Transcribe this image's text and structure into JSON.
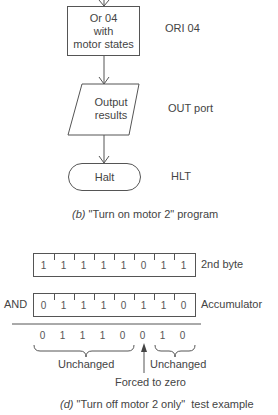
{
  "flowchart": {
    "steps": [
      {
        "shape": "process",
        "label_lines": [
          "Or 04",
          "with",
          "motor states"
        ],
        "instruction": "ORI 04"
      },
      {
        "shape": "io",
        "label_lines": [
          "Output",
          "results"
        ],
        "instruction": "OUT port"
      },
      {
        "shape": "terminal",
        "label_lines": [
          "Halt"
        ],
        "instruction": "HLT"
      }
    ],
    "caption_letter": "(b)",
    "caption_text": "\"Turn on motor 2\" program"
  },
  "and_example": {
    "operator": "AND",
    "rows": [
      {
        "label": "2nd byte",
        "bits": [
          "1",
          "1",
          "1",
          "1",
          "1",
          "0",
          "1",
          "1"
        ]
      },
      {
        "label": "Accumulator",
        "bits": [
          "0",
          "1",
          "1",
          "1",
          "0",
          "1",
          "1",
          "0"
        ]
      }
    ],
    "result_bits": [
      "0",
      "1",
      "1",
      "1",
      "0",
      "0",
      "1",
      "0"
    ],
    "annotations": {
      "left_group": "Unchanged",
      "right_group": "Unchanged",
      "forced": "Forced to zero"
    },
    "caption_letter": "(d)",
    "caption_text": "\"Turn off motor 2 only\"  test example"
  }
}
